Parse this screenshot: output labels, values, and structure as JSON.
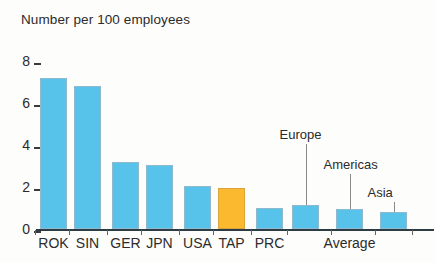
{
  "chart_data": {
    "type": "bar",
    "title": "Number per 100 employees",
    "xlabel": "",
    "ylabel": "",
    "ylim": [
      0,
      8
    ],
    "yticks": [
      0,
      2,
      4,
      6,
      8
    ],
    "grid": false,
    "legend": null,
    "categories": [
      "ROK",
      "SIN",
      "GER",
      "JPN",
      "USA",
      "TAP",
      "PRC",
      "Europe",
      "Americas",
      "Asia"
    ],
    "values": [
      7.2,
      6.8,
      3.2,
      3.05,
      2.05,
      1.95,
      1.0,
      1.15,
      0.95,
      0.8
    ],
    "bars": [
      {
        "label": "ROK",
        "value": 7.2,
        "color": "#58c3ea",
        "axis_label": "ROK",
        "annotation": null
      },
      {
        "label": "SIN",
        "value": 6.8,
        "color": "#58c3ea",
        "axis_label": "SIN",
        "annotation": null
      },
      {
        "label": "GER",
        "value": 3.2,
        "color": "#58c3ea",
        "axis_label": "GER",
        "annotation": null
      },
      {
        "label": "JPN",
        "value": 3.05,
        "color": "#58c3ea",
        "axis_label": "JPN",
        "annotation": null
      },
      {
        "label": "USA",
        "value": 2.05,
        "color": "#58c3ea",
        "axis_label": "USA",
        "annotation": null
      },
      {
        "label": "TAP",
        "value": 1.95,
        "color": "#fab92f",
        "axis_label": "TAP",
        "annotation": null
      },
      {
        "label": "PRC",
        "value": 1.0,
        "color": "#58c3ea",
        "axis_label": "PRC",
        "annotation": null
      },
      {
        "label": "Europe",
        "value": 1.15,
        "color": "#58c3ea",
        "axis_label": "",
        "annotation": "Europe"
      },
      {
        "label": "Americas",
        "value": 0.95,
        "color": "#58c3ea",
        "axis_label": "",
        "annotation": "Americas"
      },
      {
        "label": "Asia",
        "value": 0.8,
        "color": "#58c3ea",
        "axis_label": "",
        "annotation": "Asia"
      }
    ],
    "annotations": [
      {
        "text": "Europe",
        "target": "Europe"
      },
      {
        "text": "Americas",
        "target": "Americas"
      },
      {
        "text": "Asia",
        "target": "Asia"
      }
    ],
    "group_labels": [
      {
        "text": "Average",
        "covers": [
          "Europe",
          "Americas",
          "Asia"
        ]
      }
    ],
    "colors": {
      "bar": "#58c3ea",
      "bar_accent": "#fab92f",
      "axis": "#2d3b45",
      "text": "#2b2b2b",
      "background": "#fdfdfb",
      "leader_line": "#8a8a8a"
    }
  }
}
